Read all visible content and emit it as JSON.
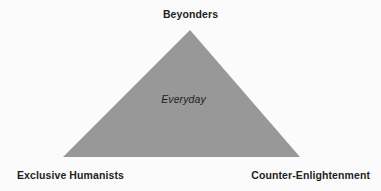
{
  "diagram": {
    "type": "triangle",
    "title": "",
    "background_color": "#fbfbfb",
    "shape": {
      "name": "triangle-shape",
      "fill_color": "#989898",
      "stroke": "none",
      "apex": {
        "x": 190,
        "y": 30
      },
      "bottom_left": {
        "x": 63,
        "y": 157
      },
      "bottom_right": {
        "x": 300,
        "y": 157
      }
    },
    "vertex_labels": {
      "apex": "Beyonders",
      "bottom_left": "Exclusive Humanists",
      "bottom_right": "Counter-Enlightenment"
    },
    "interior_label": "Everyday",
    "label_color": "#231f20",
    "interior_label_color": "#231f20"
  }
}
